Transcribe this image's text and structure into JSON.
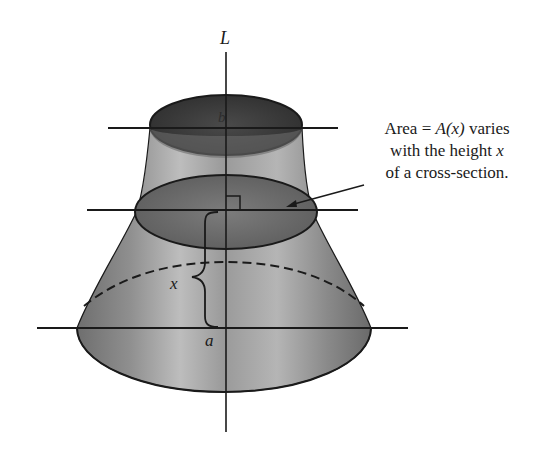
{
  "figure": {
    "axis_label": "L",
    "top_label": "b",
    "bottom_label": "a",
    "height_label": "x",
    "annotation": {
      "line1_pre": "Area = ",
      "line1_func": "A",
      "line1_arg": "(x)",
      "line1_post": " varies",
      "line2_pre": "with the height ",
      "line2_var": "x",
      "line3": "of a cross-section."
    }
  },
  "colors": {
    "ink": "#1a1a1a",
    "solid_fill_dark": "#5a5a5a",
    "solid_fill_light": "#b8b8b8",
    "background": "#ffffff"
  }
}
